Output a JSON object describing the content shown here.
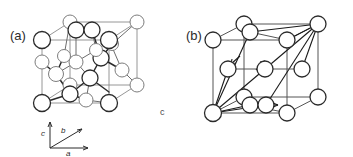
{
  "figure": {
    "background_color": "#ffffff",
    "line_color": "#2b2b2b",
    "atom_fill_color": "#ffffff",
    "cell_edge_color": "#8a8a8a",
    "stray_label": "c"
  },
  "panels": [
    {
      "id": "panel-a",
      "label": "(a)",
      "structure_type": "diamond-cubic",
      "description": "Cubic unit cell with corner and face-centre atoms plus four interior tetrahedrally bonded atoms",
      "atom_count": 18,
      "has_bonds": true,
      "has_vectors": false
    },
    {
      "id": "panel-b",
      "label": "(b)",
      "structure_type": "face-centred-cubic",
      "description": "Cubic unit cell with corner and face-centre atoms and primitive translation vectors from the front-lower-left corner",
      "atom_count": 14,
      "has_bonds": false,
      "has_vectors": true,
      "vector_count": 6,
      "arrow_count": 3
    }
  ],
  "axes": {
    "name": "crystallographic-axis-triad",
    "a_label": "a",
    "b_label": "b",
    "c_label": "c"
  }
}
